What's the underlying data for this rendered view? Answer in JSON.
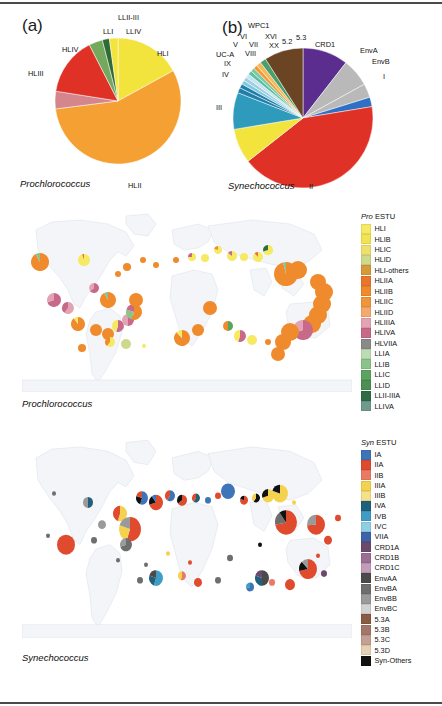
{
  "figure": {
    "panels": [
      "a",
      "b",
      "c",
      "d"
    ],
    "rule_color": "#4a4a4a"
  },
  "panel_a": {
    "letter": "(a)",
    "taxon": "Prochlorococcus",
    "chart_data": {
      "type": "pie",
      "title": "Prochlorococcus ecotype distribution",
      "categories": [
        "HLI",
        "HLII",
        "HLIII",
        "HLIV",
        "LLI",
        "LLII-III",
        "LLIV"
      ],
      "values": [
        17.0,
        56.0,
        4.5,
        15.0,
        3.5,
        1.8,
        2.2
      ],
      "colors": [
        "#f2e43c",
        "#f5a033",
        "#d4868c",
        "#e03127",
        "#74a85c",
        "#2f6b35",
        "#f2e43c"
      ],
      "labels_shown": [
        "HLI",
        "HLII",
        "HLIII",
        "HLIV",
        "LLI",
        "LLII-III",
        "LLIV"
      ]
    }
  },
  "panel_b": {
    "letter": "(b)",
    "taxon": "Synechococcus",
    "chart_data": {
      "type": "pie",
      "title": "Synechococcus clade distribution",
      "categories": [
        "I",
        "II",
        "III",
        "IV",
        "IX",
        "UC-A",
        "VIII",
        "VII",
        "V",
        "VI",
        "XVI",
        "WPC1",
        "XX",
        "5.2",
        "5.3",
        "CRD1",
        "EnvA",
        "EnvB"
      ],
      "values": [
        2.2,
        42.0,
        8.0,
        8.5,
        1.2,
        1.0,
        0.9,
        0.9,
        0.9,
        0.9,
        0.9,
        0.9,
        1.1,
        1.4,
        9.0,
        10.5,
        6.5,
        3.2
      ],
      "colors": [
        "#2f6fc4",
        "#e03127",
        "#f2e43c",
        "#2e9bbd",
        "#1f7fa8",
        "#1f7fa8",
        "#7fc8e0",
        "#9ecfe3",
        "#c6e4ef",
        "#5ec0a0",
        "#79c9a8",
        "#f59a2e",
        "#f3b95e",
        "#49a06a",
        "#6b4423",
        "#5b2d8e",
        "#b9b9b9",
        "#b9b9b9"
      ],
      "labels_shown": [
        "WPC1",
        "XVI",
        "VI",
        "XX",
        "5.2",
        "5.3",
        "CRD1",
        "V",
        "VII",
        "UC-A",
        "VIII",
        "IX",
        "IV",
        "III",
        "II",
        "I",
        "EnvA",
        "EnvB"
      ]
    }
  },
  "panel_c": {
    "letter": "(c)",
    "taxon": "Prochlorococcus",
    "legend_title_italic": "Pro",
    "legend_title_rest": " ESTU",
    "legend": [
      {
        "label": "HLI",
        "color": "#f6ea63"
      },
      {
        "label": "HLIB",
        "color": "#f2e451"
      },
      {
        "label": "HLIC",
        "color": "#efe06e"
      },
      {
        "label": "HLID",
        "color": "#cdd98b"
      },
      {
        "label": "HLI-others",
        "color": "#d79a3a"
      },
      {
        "label": "HLIIA",
        "color": "#e8762c"
      },
      {
        "label": "HLIIB",
        "color": "#ef8a2d"
      },
      {
        "label": "HLIIC",
        "color": "#f0953a"
      },
      {
        "label": "HLIID",
        "color": "#f3aa6a"
      },
      {
        "label": "HLIIIA",
        "color": "#e2a3b4"
      },
      {
        "label": "HLIVA",
        "color": "#c9698a"
      },
      {
        "label": "HLVIIA",
        "color": "#8a8a8a"
      },
      {
        "label": "LLIA",
        "color": "#bcdcb4"
      },
      {
        "label": "LLIB",
        "color": "#8cc38a"
      },
      {
        "label": "LLIC",
        "color": "#5aa45f"
      },
      {
        "label": "LLID",
        "color": "#4c8f52"
      },
      {
        "label": "LLII-IIIA",
        "color": "#2f6b44"
      },
      {
        "label": "LLIVA",
        "color": "#6f9a8c"
      }
    ],
    "chart_data": {
      "type": "pie-map",
      "title": "Prochlorococcus ESTU global distribution",
      "note": "Pie markers sized by abundance, positioned on world map stations"
    }
  },
  "panel_d": {
    "letter": "(d)",
    "taxon": "Synechococcus",
    "legend_title_italic": "Syn",
    "legend_title_rest": " ESTU",
    "legend": [
      {
        "label": "IA",
        "color": "#3d75b8"
      },
      {
        "label": "IIA",
        "color": "#e04b2e"
      },
      {
        "label": "IIB",
        "color": "#ea7a64"
      },
      {
        "label": "IIIA",
        "color": "#f5d24e"
      },
      {
        "label": "IIIB",
        "color": "#f7e08a"
      },
      {
        "label": "IVA",
        "color": "#20607c"
      },
      {
        "label": "IVB",
        "color": "#3f9cc4"
      },
      {
        "label": "IVC",
        "color": "#8fcfe3"
      },
      {
        "label": "VIIA",
        "color": "#3f63a8"
      },
      {
        "label": "CRD1A",
        "color": "#6b4a6e"
      },
      {
        "label": "CRD1B",
        "color": "#9a6f93"
      },
      {
        "label": "CRD1C",
        "color": "#c49bb8"
      },
      {
        "label": "EnvAA",
        "color": "#4a4a4a"
      },
      {
        "label": "EnvBA",
        "color": "#6e6e6e"
      },
      {
        "label": "EnvBB",
        "color": "#9a9a9a"
      },
      {
        "label": "EnvBC",
        "color": "#d2d2d2"
      },
      {
        "label": "5.3A",
        "color": "#8a5a42"
      },
      {
        "label": "5.3B",
        "color": "#a4766a"
      },
      {
        "label": "5.3C",
        "color": "#c49f92"
      },
      {
        "label": "5.3D",
        "color": "#e6d0b4"
      },
      {
        "label": "Syn-Others",
        "color": "#111111"
      }
    ],
    "chart_data": {
      "type": "pie-map",
      "title": "Synechococcus ESTU global distribution",
      "note": "Pie markers sized by abundance, positioned on world map stations"
    }
  }
}
